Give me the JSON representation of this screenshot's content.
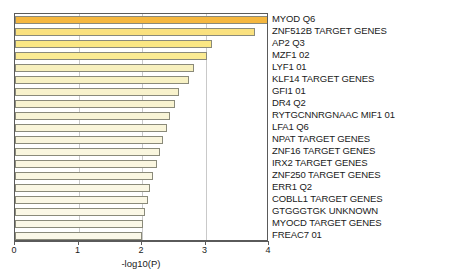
{
  "chart_data": {
    "type": "bar",
    "orientation": "horizontal",
    "title": "",
    "xlabel": "-log10(P)",
    "ylabel": "",
    "xlim": [
      0,
      4
    ],
    "xticks": [
      0,
      1,
      2,
      3,
      4
    ],
    "xtick_labels": [
      "0",
      "1",
      "2",
      "3",
      "4"
    ],
    "grid": true,
    "legend": "none",
    "categories": [
      "MYOD Q6",
      "ZNF512B TARGET GENES",
      "AP2 Q3",
      "MZF1 02",
      "LYF1 01",
      "KLF14 TARGET GENES",
      "GFI1 01",
      "DR4 Q2",
      "RYTGCNNRGNAAC MIF1 01",
      "LFA1 Q6",
      "NPAT TARGET GENES",
      "ZNF16 TARGET GENES",
      "IRX2 TARGET GENES",
      "ZNF250 TARGET GENES",
      "ERR1 Q2",
      "COBLL1 TARGET GENES",
      "GTGGGTGK UNKNOWN",
      "MYOCD TARGET GENES",
      "FREAC7 01"
    ],
    "values": [
      4.03,
      3.78,
      3.11,
      3.03,
      2.82,
      2.74,
      2.58,
      2.52,
      2.44,
      2.39,
      2.33,
      2.29,
      2.24,
      2.18,
      2.13,
      2.09,
      2.05,
      2.02,
      2.0
    ],
    "bar_colors": [
      "#F5B73F",
      "#FAE17F",
      "#FAE784",
      "#FBEB93",
      "#F7F0BE",
      "#F7F1C4",
      "#F8F2CC",
      "#F8F3D0",
      "#F8F4D6",
      "#F9F5DA",
      "#F9F5DC",
      "#F9F6DE",
      "#FAF6E0",
      "#FAF7E2",
      "#FAF7E4",
      "#FAF7E5",
      "#FBF8E6",
      "#FBF8E7",
      "#FBF8E8"
    ],
    "bar_border_color": "#8a8a7a",
    "axis_color": "#5a5a5a",
    "grid_color": "#c9c9c9",
    "background": "#ffffff"
  }
}
